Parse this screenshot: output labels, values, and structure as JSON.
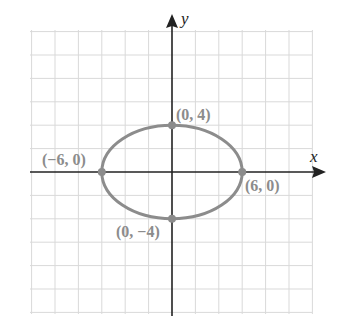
{
  "chart_data": {
    "type": "line",
    "title": "",
    "xlabel": "x",
    "ylabel": "y",
    "grid": true,
    "grid_step": 2,
    "xlim": [
      -12,
      12
    ],
    "ylim": [
      -12,
      12
    ],
    "series": [
      {
        "name": "ellipse",
        "equation": "x^2/36 + y^2/16 = 1",
        "a": 6,
        "b": 4,
        "color": "#8c8c8c"
      }
    ],
    "points": [
      {
        "x": 0,
        "y": 4,
        "label": "(0, 4)"
      },
      {
        "x": -6,
        "y": 0,
        "label": "(−6, 0)"
      },
      {
        "x": 6,
        "y": 0,
        "label": "(6, 0)"
      },
      {
        "x": 0,
        "y": -4,
        "label": "(0, −4)"
      }
    ]
  },
  "labels": {
    "x_axis": "x",
    "y_axis": "y",
    "top": "(0, 4)",
    "left": "(−6, 0)",
    "right": "(6, 0)",
    "bottom": "(0, −4)"
  },
  "colors": {
    "grid": "#d9d9d9",
    "axis": "#222222",
    "curve": "#8c8c8c",
    "label": "#8c8c8c"
  }
}
